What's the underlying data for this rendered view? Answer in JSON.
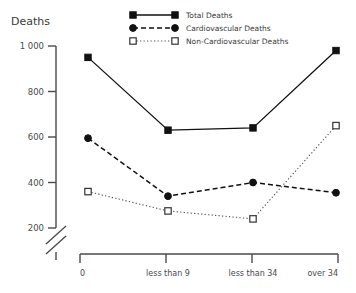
{
  "chart_data": {
    "type": "line",
    "title": "",
    "ylabel": "Deaths",
    "xlabel": "",
    "categories": [
      "0",
      "less than 9",
      "less than 34",
      "over 34"
    ],
    "yticks": [
      "1 000",
      "800",
      "600",
      "400",
      "200"
    ],
    "ytick_values": [
      1000,
      800,
      600,
      400,
      200
    ],
    "ylim": [
      200,
      1000
    ],
    "y_axis_broken": true,
    "grid": false,
    "legend_position": "top-center",
    "series": [
      {
        "name": "Total Deaths",
        "marker": "filled-square",
        "line_style": "solid",
        "color": "#111111",
        "values": [
          950,
          630,
          640,
          980
        ]
      },
      {
        "name": "Cardiovascular Deaths",
        "marker": "filled-circle",
        "line_style": "dashed",
        "color": "#111111",
        "values": [
          595,
          340,
          400,
          355
        ]
      },
      {
        "name": "Non-Cardiovascular Deaths",
        "marker": "open-square",
        "line_style": "dotted",
        "color": "#555555",
        "values": [
          360,
          275,
          240,
          650
        ]
      }
    ]
  },
  "legend": {
    "items": [
      {
        "label": "Total Deaths"
      },
      {
        "label": "Cardiovascular Deaths"
      },
      {
        "label": "Non-Cardiovascular Deaths"
      }
    ]
  },
  "axes": {
    "y_title": "Deaths"
  }
}
